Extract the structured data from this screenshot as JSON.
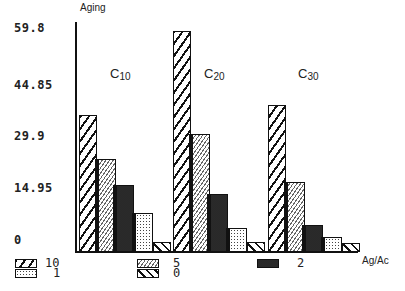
{
  "chart_data": {
    "type": "bar",
    "title": "",
    "ylabel": "Aging",
    "xlabel": "Ag/Ac",
    "ylim": [
      0,
      59.8
    ],
    "yticks": [
      0,
      14.95,
      29.9,
      44.85,
      59.8
    ],
    "ytick_labels": [
      "0",
      "14.95",
      "29.9",
      "44.85",
      "59.8"
    ],
    "categories": [
      "C10",
      "C20",
      "C30"
    ],
    "series": [
      {
        "name": "10",
        "pattern": "wide-diagonal-hatch",
        "values": [
          36.5,
          59.0,
          39.2
        ]
      },
      {
        "name": "5",
        "pattern": "fine-diagonal-hatch",
        "values": [
          24.8,
          31.5,
          18.7
        ]
      },
      {
        "name": "2",
        "pattern": "dense-dots",
        "values": [
          17.9,
          15.5,
          7.2
        ]
      },
      {
        "name": "1",
        "pattern": "light-dots",
        "values": [
          10.4,
          6.4,
          4.0
        ]
      },
      {
        "name": "0",
        "pattern": "reverse-diagonal-hatch",
        "values": [
          2.7,
          2.7,
          2.4
        ]
      }
    ],
    "legend_position": "bottom",
    "grid": false
  },
  "labels": {
    "ylabel": "Aging",
    "xlabel": "Ag/Ac",
    "groups": [
      {
        "base": "C",
        "sub": "10"
      },
      {
        "base": "C",
        "sub": "20"
      },
      {
        "base": "C",
        "sub": "30"
      }
    ],
    "yticks": [
      "59.8",
      "44.85",
      "29.9",
      "14.95",
      "0"
    ],
    "legend": [
      "10",
      "1",
      "5",
      "0",
      "2"
    ]
  }
}
